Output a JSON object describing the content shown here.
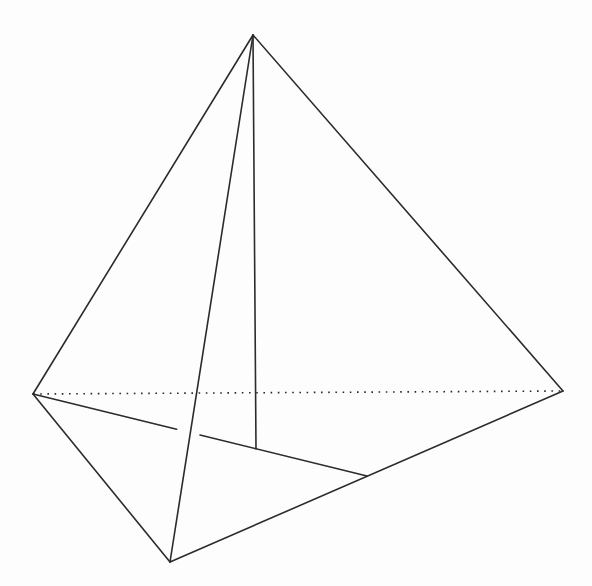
{
  "figure": {
    "name": "tetrahedron-with-base-median-and-apex-cevian",
    "background_color": "#fdfdfd",
    "stroke_color": "#2b2b2b",
    "stroke_width": 1.6,
    "dotted_dash_pattern": "1.6 5.6",
    "width": 592,
    "height": 586,
    "points": {
      "apex": [
        253,
        35
      ],
      "left_vertex": [
        33,
        394
      ],
      "right_vertex": [
        563,
        391
      ],
      "front_vertex": [
        170,
        562
      ],
      "midpoint_front_right": [
        367,
        476
      ],
      "base_centroid": [
        256,
        449
      ]
    },
    "edges": [
      {
        "name": "hidden-edge-left-right",
        "from": "left_vertex",
        "to": "right_vertex",
        "style": "dotted"
      },
      {
        "name": "edge-apex-left",
        "from": "apex",
        "to": "left_vertex",
        "style": "solid"
      },
      {
        "name": "edge-apex-right",
        "from": "apex",
        "to": "right_vertex",
        "style": "solid"
      },
      {
        "name": "edge-apex-front",
        "from": "apex",
        "to": "front_vertex",
        "style": "solid"
      },
      {
        "name": "edge-left-front",
        "from": "left_vertex",
        "to": "front_vertex",
        "style": "solid"
      },
      {
        "name": "edge-front-right",
        "from": "front_vertex",
        "to": "right_vertex",
        "style": "solid"
      },
      {
        "name": "median-left-to-midpoint",
        "from": "left_vertex",
        "to": "midpoint_front_right",
        "style": "solid",
        "gap": {
          "t_start": 0.43,
          "t_end": 0.5
        }
      },
      {
        "name": "cevian-apex-to-centroid",
        "from": "apex",
        "to": "base_centroid",
        "style": "solid"
      }
    ]
  }
}
